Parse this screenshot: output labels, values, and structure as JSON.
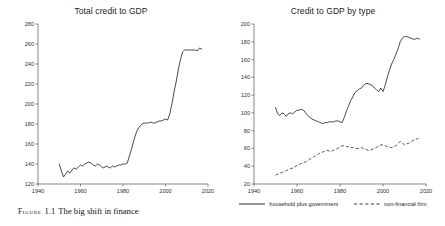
{
  "figure": {
    "caption_kicker": "Figure",
    "caption_number": "1.1",
    "caption_text": "The big shift in finance"
  },
  "colors": {
    "line": "#2b2b2b",
    "axis": "#555555",
    "background": "#ffffff"
  },
  "legend": {
    "position": "bottom-center-right-panel",
    "entries": [
      {
        "label": "household plus government",
        "style": "solid",
        "name": "legend-household-plus-government"
      },
      {
        "label": "non-financial firm",
        "style": "dashed",
        "name": "legend-non-financial-firm"
      }
    ]
  },
  "chart_data": [
    {
      "id": "total-credit-to-gdp",
      "type": "line",
      "title": "Total credit to GDP",
      "xlabel": "",
      "ylabel": "",
      "xlim": [
        1940,
        2020
      ],
      "ylim": [
        120,
        280
      ],
      "xticks": [
        1940,
        1960,
        1980,
        2000,
        2020
      ],
      "yticks": [
        120,
        140,
        160,
        180,
        200,
        220,
        240,
        260,
        280
      ],
      "grid": false,
      "legend": false,
      "series": [
        {
          "name": "total credit to GDP",
          "style": "solid",
          "x": [
            1950,
            1951,
            1952,
            1953,
            1954,
            1955,
            1956,
            1957,
            1958,
            1959,
            1960,
            1961,
            1962,
            1963,
            1964,
            1965,
            1966,
            1967,
            1968,
            1969,
            1970,
            1971,
            1972,
            1973,
            1974,
            1975,
            1976,
            1977,
            1978,
            1979,
            1980,
            1981,
            1982,
            1983,
            1984,
            1985,
            1986,
            1987,
            1988,
            1989,
            1990,
            1991,
            1992,
            1993,
            1994,
            1995,
            1996,
            1997,
            1998,
            1999,
            2000,
            2001,
            2002,
            2003,
            2004,
            2005,
            2006,
            2007,
            2008,
            2009,
            2010,
            2011,
            2012,
            2013,
            2014,
            2015,
            2016,
            2017
          ],
          "values": [
            140,
            133,
            127,
            130,
            133,
            131,
            134,
            136,
            135,
            137,
            139,
            138,
            140,
            141,
            142,
            141,
            139,
            138,
            140,
            139,
            137,
            136,
            138,
            137,
            136,
            138,
            137,
            138,
            139,
            139,
            140,
            140,
            141,
            148,
            155,
            163,
            170,
            175,
            178,
            180,
            181,
            181,
            181,
            182,
            181,
            181,
            182,
            183,
            183,
            184,
            185,
            184,
            190,
            200,
            212,
            222,
            234,
            244,
            252,
            254,
            254,
            254,
            254,
            254,
            254,
            253,
            256,
            255
          ]
        }
      ]
    },
    {
      "id": "credit-to-gdp-by-type",
      "type": "line",
      "title": "Credit to GDP by type",
      "xlabel": "",
      "ylabel": "",
      "xlim": [
        1940,
        2020
      ],
      "ylim": [
        20,
        200
      ],
      "xticks": [
        1940,
        1960,
        1980,
        2000,
        2020
      ],
      "yticks": [
        20,
        40,
        60,
        80,
        100,
        120,
        140,
        160,
        180,
        200
      ],
      "grid": false,
      "legend": true,
      "series": [
        {
          "name": "household plus government",
          "style": "solid",
          "x": [
            1950,
            1951,
            1952,
            1953,
            1954,
            1955,
            1956,
            1957,
            1958,
            1959,
            1960,
            1961,
            1962,
            1963,
            1964,
            1965,
            1966,
            1967,
            1968,
            1969,
            1970,
            1971,
            1972,
            1973,
            1974,
            1975,
            1976,
            1977,
            1978,
            1979,
            1980,
            1981,
            1982,
            1983,
            1984,
            1985,
            1986,
            1987,
            1988,
            1989,
            1990,
            1991,
            1992,
            1993,
            1994,
            1995,
            1996,
            1997,
            1998,
            1999,
            2000,
            2001,
            2002,
            2003,
            2004,
            2005,
            2006,
            2007,
            2008,
            2009,
            2010,
            2011,
            2012,
            2013,
            2014,
            2015,
            2016,
            2017
          ],
          "values": [
            106,
            99,
            97,
            100,
            99,
            96,
            99,
            100,
            99,
            101,
            103,
            103,
            104,
            103,
            100,
            97,
            95,
            93,
            92,
            91,
            90,
            89,
            88,
            89,
            89,
            90,
            90,
            90,
            91,
            91,
            90,
            89,
            95,
            102,
            108,
            114,
            118,
            123,
            125,
            127,
            128,
            131,
            133,
            133,
            132,
            131,
            128,
            126,
            124,
            128,
            124,
            131,
            140,
            148,
            155,
            160,
            166,
            172,
            180,
            184,
            186,
            186,
            185,
            184,
            183,
            183,
            184,
            183
          ]
        },
        {
          "name": "non-financial firm",
          "style": "dashed",
          "x": [
            1950,
            1951,
            1952,
            1953,
            1954,
            1955,
            1956,
            1957,
            1958,
            1959,
            1960,
            1961,
            1962,
            1963,
            1964,
            1965,
            1966,
            1967,
            1968,
            1969,
            1970,
            1971,
            1972,
            1973,
            1974,
            1975,
            1976,
            1977,
            1978,
            1979,
            1980,
            1981,
            1982,
            1983,
            1984,
            1985,
            1986,
            1987,
            1988,
            1989,
            1990,
            1991,
            1992,
            1993,
            1994,
            1995,
            1996,
            1997,
            1998,
            1999,
            2000,
            2001,
            2002,
            2003,
            2004,
            2005,
            2006,
            2007,
            2008,
            2009,
            2010,
            2011,
            2012,
            2013,
            2014,
            2015,
            2016,
            2017
          ],
          "values": [
            30,
            31,
            32,
            33,
            34,
            35,
            36,
            37,
            38,
            39,
            41,
            42,
            43,
            44,
            45,
            46,
            48,
            49,
            51,
            52,
            54,
            55,
            56,
            57,
            58,
            57,
            57,
            58,
            59,
            60,
            62,
            63,
            63,
            62,
            62,
            61,
            61,
            60,
            60,
            60,
            61,
            60,
            59,
            58,
            58,
            59,
            60,
            61,
            63,
            64,
            64,
            63,
            62,
            61,
            61,
            62,
            63,
            65,
            68,
            66,
            64,
            65,
            66,
            67,
            69,
            70,
            71,
            72
          ]
        }
      ]
    }
  ]
}
